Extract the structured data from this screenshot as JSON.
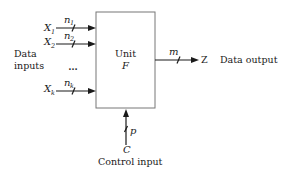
{
  "diagram": {
    "unit": {
      "line1": "Unit",
      "line2": "F"
    },
    "data_inputs_label": {
      "line1": "Data",
      "line2": "inputs"
    },
    "inputs": [
      {
        "name": "X",
        "sub": "1",
        "width_name": "n",
        "width_sub": "1"
      },
      {
        "name": "X",
        "sub": "2",
        "width_name": "n",
        "width_sub": "2"
      },
      {
        "name": "X",
        "sub": "k",
        "width_name": "n",
        "width_sub": "k"
      }
    ],
    "ellipsis": "…",
    "output": {
      "width_label": "m",
      "name": "Z",
      "label": "Data output"
    },
    "control": {
      "name": "C",
      "width_label": "p",
      "label": "Control input"
    }
  }
}
